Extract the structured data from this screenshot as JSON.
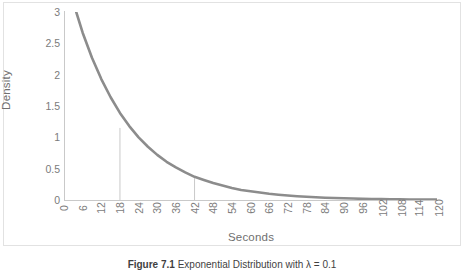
{
  "figure": {
    "caption_label": "Figure 7.1",
    "caption_text": "Exponential Distribution with λ = 0.1"
  },
  "axes": {
    "y_title": "Density",
    "x_title": "Seconds",
    "y_ticks": [
      "0",
      "0.5",
      "1",
      "1.5",
      "2",
      "2.5",
      "3"
    ],
    "x_ticks": [
      "0",
      "6",
      "12",
      "18",
      "24",
      "30",
      "36",
      "42",
      "48",
      "54",
      "60",
      "66",
      "72",
      "78",
      "84",
      "90",
      "96",
      "102",
      "108",
      "114",
      "120"
    ]
  },
  "colors": {
    "curve": "#8c8c8c",
    "axis": "#c9c9c9",
    "dropline": "#c9c9c9",
    "tick_text": "#7b7b7b",
    "title_text": "#6f6f6f",
    "frame": "#e2e2e2",
    "background": "#ffffff"
  },
  "chart_data": {
    "type": "line",
    "title": "",
    "xlabel": "Seconds",
    "ylabel": "Density",
    "xlim": [
      0,
      120
    ],
    "ylim": [
      0,
      3
    ],
    "xticks": [
      0,
      6,
      12,
      18,
      24,
      30,
      36,
      42,
      48,
      54,
      60,
      66,
      72,
      78,
      84,
      90,
      96,
      102,
      108,
      114,
      120
    ],
    "yticks": [
      0,
      0.5,
      1,
      1.5,
      2,
      2.5,
      3
    ],
    "grid": false,
    "legend": "none",
    "series": [
      {
        "name": "Exponential density",
        "x": [
          0,
          3,
          6,
          9,
          12,
          15,
          18,
          21,
          24,
          27,
          30,
          33,
          36,
          39,
          42,
          45,
          48,
          51,
          54,
          57,
          60,
          63,
          66,
          69,
          72,
          75,
          78,
          81,
          84,
          87,
          90,
          93,
          96,
          99,
          102,
          105,
          108,
          111,
          114,
          117,
          120
        ],
        "values": [
          3.7,
          3.15,
          2.67,
          2.27,
          1.93,
          1.64,
          1.39,
          1.18,
          1.0,
          0.85,
          0.72,
          0.61,
          0.52,
          0.44,
          0.37,
          0.32,
          0.27,
          0.23,
          0.19,
          0.16,
          0.14,
          0.12,
          0.1,
          0.085,
          0.072,
          0.061,
          0.052,
          0.044,
          0.037,
          0.032,
          0.027,
          0.023,
          0.019,
          0.016,
          0.014,
          0.012,
          0.01,
          0.0085,
          0.0072,
          0.0061,
          0.0052
        ]
      }
    ],
    "annotations": [
      {
        "name": "dropline-18",
        "x": 18,
        "y": 1.15,
        "style": "vertical-line-to-axis"
      },
      {
        "name": "dropline-42",
        "x": 42,
        "y": 0.35,
        "style": "vertical-line-to-axis"
      }
    ]
  }
}
